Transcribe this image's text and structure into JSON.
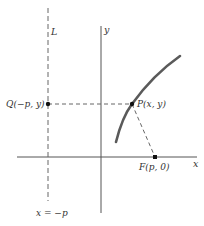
{
  "diagram": {
    "colors": {
      "axis": "#555555",
      "curve": "#5a5a5a",
      "dashed": "#666666",
      "point": "#111111",
      "text": "#333333"
    },
    "axes": {
      "x_label": "x",
      "y_label": "y"
    },
    "directrix": {
      "label": "L",
      "equation": "x = −p"
    },
    "points": [
      {
        "id": "Q",
        "label": "Q(−p, y)"
      },
      {
        "id": "P",
        "label": "P(x, y)"
      },
      {
        "id": "F",
        "label": "F(p, 0)"
      }
    ]
  }
}
